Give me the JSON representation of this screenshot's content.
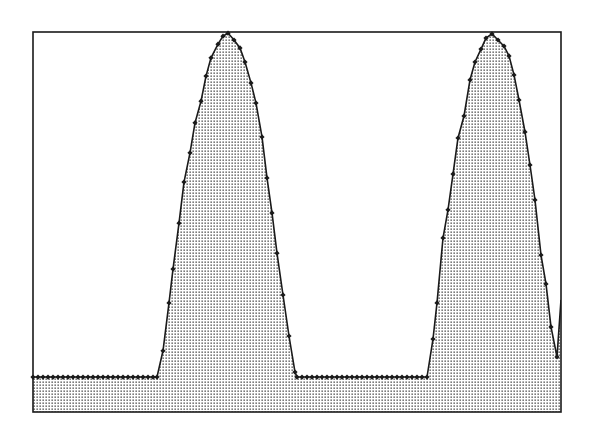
{
  "chart_data": {
    "type": "area",
    "title": "",
    "xlabel": "",
    "ylabel": "",
    "grid": false,
    "legend": null,
    "fill_pattern": "dotted",
    "colors": {
      "line": "#1a1a1a",
      "marker": "#1a1a1a",
      "fill_dot": "#333333",
      "frame": "#1a1a1a",
      "background": "#ffffff"
    },
    "frame_px": {
      "left": 33,
      "top": 32,
      "right": 561,
      "bottom": 412
    },
    "ylim": [
      0,
      100
    ],
    "xlim": [
      0,
      528
    ],
    "note": "x in pixels from left frame edge; y scaled 0 (frame bottom) to 100 (frame top)",
    "series": [
      {
        "name": "signal",
        "points": [
          [
            0,
            9.2
          ],
          [
            5,
            9.2
          ],
          [
            10,
            9.2
          ],
          [
            15,
            9.2
          ],
          [
            20,
            9.2
          ],
          [
            25,
            9.2
          ],
          [
            30,
            9.2
          ],
          [
            35,
            9.2
          ],
          [
            40,
            9.2
          ],
          [
            45,
            9.2
          ],
          [
            50,
            9.2
          ],
          [
            55,
            9.2
          ],
          [
            60,
            9.2
          ],
          [
            65,
            9.2
          ],
          [
            70,
            9.2
          ],
          [
            75,
            9.2
          ],
          [
            80,
            9.2
          ],
          [
            85,
            9.2
          ],
          [
            90,
            9.2
          ],
          [
            95,
            9.2
          ],
          [
            100,
            9.2
          ],
          [
            105,
            9.2
          ],
          [
            110,
            9.2
          ],
          [
            115,
            9.2
          ],
          [
            120,
            9.2
          ],
          [
            124,
            9.2
          ],
          [
            130,
            16.1
          ],
          [
            136,
            28.7
          ],
          [
            140,
            37.6
          ],
          [
            146,
            49.7
          ],
          [
            151,
            60.5
          ],
          [
            157,
            68.2
          ],
          [
            162,
            76.1
          ],
          [
            168,
            81.8
          ],
          [
            173,
            88.4
          ],
          [
            178,
            93.2
          ],
          [
            185,
            96.8
          ],
          [
            190,
            98.9
          ],
          [
            195,
            99.7
          ],
          [
            201,
            97.9
          ],
          [
            207,
            95.8
          ],
          [
            212,
            92.1
          ],
          [
            218,
            86.6
          ],
          [
            223,
            81.3
          ],
          [
            229,
            72.4
          ],
          [
            234,
            61.6
          ],
          [
            239,
            52.4
          ],
          [
            244,
            41.8
          ],
          [
            250,
            30.8
          ],
          [
            256,
            20.0
          ],
          [
            262,
            10.5
          ],
          [
            264,
            9.2
          ],
          [
            269,
            9.2
          ],
          [
            274,
            9.2
          ],
          [
            279,
            9.2
          ],
          [
            284,
            9.2
          ],
          [
            289,
            9.2
          ],
          [
            294,
            9.2
          ],
          [
            299,
            9.2
          ],
          [
            304,
            9.2
          ],
          [
            309,
            9.2
          ],
          [
            314,
            9.2
          ],
          [
            319,
            9.2
          ],
          [
            324,
            9.2
          ],
          [
            329,
            9.2
          ],
          [
            334,
            9.2
          ],
          [
            339,
            9.2
          ],
          [
            344,
            9.2
          ],
          [
            349,
            9.2
          ],
          [
            354,
            9.2
          ],
          [
            359,
            9.2
          ],
          [
            364,
            9.2
          ],
          [
            369,
            9.2
          ],
          [
            374,
            9.2
          ],
          [
            379,
            9.2
          ],
          [
            384,
            9.2
          ],
          [
            389,
            9.2
          ],
          [
            394,
            9.2
          ],
          [
            400,
            19.2
          ],
          [
            404,
            28.7
          ],
          [
            410,
            45.8
          ],
          [
            415,
            53.2
          ],
          [
            420,
            62.6
          ],
          [
            425,
            72.1
          ],
          [
            431,
            77.9
          ],
          [
            437,
            87.4
          ],
          [
            442,
            92.1
          ],
          [
            448,
            95.5
          ],
          [
            453,
            98.4
          ],
          [
            459,
            99.5
          ],
          [
            465,
            97.9
          ],
          [
            471,
            96.3
          ],
          [
            476,
            93.7
          ],
          [
            481,
            88.7
          ],
          [
            486,
            82.1
          ],
          [
            492,
            73.7
          ],
          [
            497,
            65.0
          ],
          [
            502,
            55.8
          ],
          [
            508,
            41.3
          ],
          [
            513,
            33.7
          ],
          [
            518,
            22.4
          ],
          [
            524,
            14.5
          ],
          [
            528,
            29.5
          ]
        ],
        "markers": true,
        "marker_shape": "diamond"
      }
    ],
    "peaks": [
      {
        "x": 195,
        "value": 99.7
      },
      {
        "x": 459,
        "value": 99.5
      }
    ]
  }
}
